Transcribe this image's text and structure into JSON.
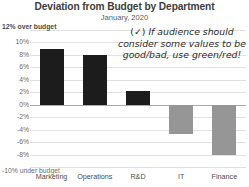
{
  "chart_data": {
    "type": "bar",
    "title": "Deviation from Budget by Department",
    "subtitle": "January, 2020",
    "categories": [
      "Marketing",
      "Operations",
      "R&D",
      "IT",
      "Finance"
    ],
    "values": [
      9.0,
      8.0,
      2.2,
      -4.7,
      -8.0
    ],
    "series": [
      {
        "name": "Deviation from budget",
        "values": [
          9.0,
          8.0,
          2.2,
          -4.7,
          -8.0
        ]
      }
    ],
    "xlabel": "",
    "ylabel": "",
    "ylim": [
      -10,
      12
    ],
    "ytick_values": [
      12,
      10,
      8,
      6,
      4,
      2,
      0,
      -2,
      -4,
      -6,
      -8,
      -10
    ],
    "ytick_labels": [
      "12%",
      "10%",
      "8%",
      "6%",
      "4%",
      "2%",
      "0%",
      "-2%",
      "-4%",
      "-6%",
      "-8%",
      "-10%"
    ],
    "axis_top_caption": "over budget",
    "axis_top_value": "12%",
    "axis_bottom_caption": "under budget",
    "axis_bottom_value": "-10%",
    "grid": true,
    "legend": "none",
    "positive_color": "#1c1c1c",
    "negative_color": "#969696",
    "gridline_color": "#e2e2e2",
    "zeroline_color": "#aaaaaa"
  },
  "annotation": {
    "check_glyph": "(✓)",
    "line1": "If audience should",
    "line2": "consider some values to be",
    "line3": "good/bad, use green/red!",
    "full_text": "(✓) If audience should consider some values to be good/bad, use green/red!"
  }
}
